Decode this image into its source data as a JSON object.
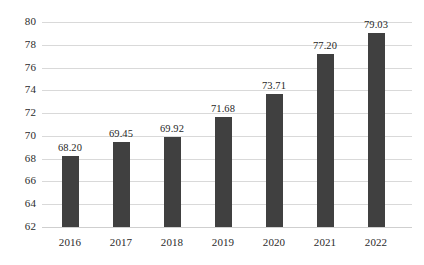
{
  "chart_data": {
    "type": "bar",
    "title": "",
    "subtitle": "",
    "xlabel": "",
    "ylabel": "",
    "categories": [
      "2016",
      "2017",
      "2018",
      "2019",
      "2020",
      "2021",
      "2022"
    ],
    "values": [
      68.2,
      69.45,
      69.92,
      71.68,
      73.71,
      77.2,
      79.03
    ],
    "data_labels": [
      "68.20",
      "69.45",
      "69.92",
      "71.68",
      "73.71",
      "77.20",
      "79.03"
    ],
    "ylim": [
      62,
      80
    ],
    "ytick_values": [
      80,
      78,
      76,
      74,
      72,
      70,
      68,
      66,
      64,
      62
    ],
    "ytick_labels": [
      "80",
      "78",
      "76",
      "74",
      "72",
      "70",
      "68",
      "66",
      "64",
      "62"
    ],
    "ystep": 2,
    "grid": true,
    "grid_axis": "y",
    "legend": false,
    "legend_position": "none",
    "bar_color": "#404040",
    "grid_color": "#D9D9D9",
    "background_color": "#FFFFFF",
    "text_color": "#2B2B2B"
  }
}
